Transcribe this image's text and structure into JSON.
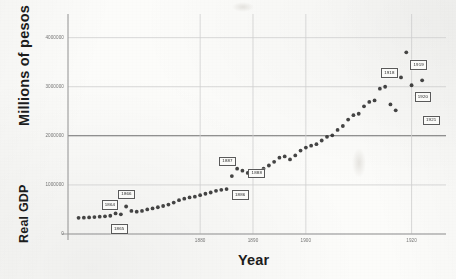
{
  "chart_data": {
    "type": "scatter",
    "title": "",
    "xlabel": "Year",
    "ylabel": "Millions of pesos",
    "ylabel_secondary": "Real GDP",
    "xlim": [
      1855,
      1925
    ],
    "ylim": [
      0,
      4400000
    ],
    "xticks": [
      1880,
      1890,
      1900,
      1920
    ],
    "xtick_labels": [
      "1880",
      "1890",
      "1900",
      "1920"
    ],
    "yticks": [
      0,
      1000000,
      2000000,
      3000000,
      4000000
    ],
    "ytick_labels": [
      "0",
      "1000000",
      "2000000",
      "3000000",
      "4000000"
    ],
    "grid": true,
    "legend": false,
    "point_color": "#2b2b2b",
    "marker": "circle",
    "annotations": [
      {
        "label": "1864",
        "year": 1864,
        "value": 420000
      },
      {
        "label": "1865",
        "year": 1865,
        "value": 400000
      },
      {
        "label": "1866",
        "year": 1866,
        "value": 560000
      },
      {
        "label": "1886",
        "year": 1886,
        "value": 1180000
      },
      {
        "label": "1887",
        "year": 1887,
        "value": 1330000
      },
      {
        "label": "1888",
        "year": 1888,
        "value": 1290000
      },
      {
        "label": "1918",
        "year": 1918,
        "value": 3190000
      },
      {
        "label": "1919",
        "year": 1919,
        "value": 3700000
      },
      {
        "label": "1920",
        "year": 1920,
        "value": 3030000
      },
      {
        "label": "1921",
        "year": 1921,
        "value": 2820000
      }
    ],
    "points": [
      {
        "year": 1857,
        "value": 330000
      },
      {
        "year": 1858,
        "value": 332000
      },
      {
        "year": 1859,
        "value": 338000
      },
      {
        "year": 1860,
        "value": 345000
      },
      {
        "year": 1861,
        "value": 352000
      },
      {
        "year": 1862,
        "value": 360000
      },
      {
        "year": 1863,
        "value": 372000
      },
      {
        "year": 1864,
        "value": 420000
      },
      {
        "year": 1865,
        "value": 400000
      },
      {
        "year": 1866,
        "value": 560000
      },
      {
        "year": 1867,
        "value": 470000
      },
      {
        "year": 1868,
        "value": 455000
      },
      {
        "year": 1869,
        "value": 470000
      },
      {
        "year": 1870,
        "value": 500000
      },
      {
        "year": 1871,
        "value": 520000
      },
      {
        "year": 1872,
        "value": 545000
      },
      {
        "year": 1873,
        "value": 570000
      },
      {
        "year": 1874,
        "value": 600000
      },
      {
        "year": 1875,
        "value": 640000
      },
      {
        "year": 1876,
        "value": 690000
      },
      {
        "year": 1877,
        "value": 720000
      },
      {
        "year": 1878,
        "value": 745000
      },
      {
        "year": 1879,
        "value": 760000
      },
      {
        "year": 1880,
        "value": 790000
      },
      {
        "year": 1881,
        "value": 820000
      },
      {
        "year": 1882,
        "value": 845000
      },
      {
        "year": 1883,
        "value": 880000
      },
      {
        "year": 1884,
        "value": 900000
      },
      {
        "year": 1885,
        "value": 915000
      },
      {
        "year": 1886,
        "value": 1180000
      },
      {
        "year": 1887,
        "value": 1330000
      },
      {
        "year": 1888,
        "value": 1290000
      },
      {
        "year": 1889,
        "value": 1245000
      },
      {
        "year": 1890,
        "value": 1220000
      },
      {
        "year": 1891,
        "value": 1265000
      },
      {
        "year": 1892,
        "value": 1330000
      },
      {
        "year": 1893,
        "value": 1395000
      },
      {
        "year": 1894,
        "value": 1470000
      },
      {
        "year": 1895,
        "value": 1555000
      },
      {
        "year": 1896,
        "value": 1580000
      },
      {
        "year": 1897,
        "value": 1520000
      },
      {
        "year": 1898,
        "value": 1600000
      },
      {
        "year": 1899,
        "value": 1700000
      },
      {
        "year": 1900,
        "value": 1760000
      },
      {
        "year": 1901,
        "value": 1800000
      },
      {
        "year": 1902,
        "value": 1830000
      },
      {
        "year": 1903,
        "value": 1905000
      },
      {
        "year": 1904,
        "value": 1980000
      },
      {
        "year": 1905,
        "value": 2010000
      },
      {
        "year": 1906,
        "value": 2120000
      },
      {
        "year": 1907,
        "value": 2200000
      },
      {
        "year": 1908,
        "value": 2330000
      },
      {
        "year": 1909,
        "value": 2420000
      },
      {
        "year": 1910,
        "value": 2450000
      },
      {
        "year": 1911,
        "value": 2600000
      },
      {
        "year": 1912,
        "value": 2690000
      },
      {
        "year": 1913,
        "value": 2720000
      },
      {
        "year": 1914,
        "value": 2960000
      },
      {
        "year": 1915,
        "value": 3000000
      },
      {
        "year": 1916,
        "value": 2640000
      },
      {
        "year": 1917,
        "value": 2520000
      },
      {
        "year": 1918,
        "value": 3190000
      },
      {
        "year": 1919,
        "value": 3700000
      },
      {
        "year": 1920,
        "value": 3030000
      },
      {
        "year": 1921,
        "value": 2820000
      },
      {
        "year": 1922,
        "value": 3130000
      }
    ]
  },
  "plot": {
    "left": 68,
    "right": 438,
    "top": 18,
    "bottom": 234,
    "heavy_gridline_value": 2000000,
    "frame_color": "#b9b9b9",
    "grid_color": "#cfcfcf"
  }
}
